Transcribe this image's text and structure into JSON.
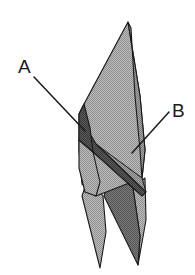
{
  "figure": {
    "background_color": "#ffffff",
    "outline_color": "#1a1a1a",
    "fill_light": "#a9a9a9",
    "fill_mid": "#939393",
    "fill_dark": "#6b6b6b",
    "fill_darkest": "#4a4a4a"
  },
  "labels": [
    {
      "id": "A",
      "text": "A",
      "text_x": 18,
      "text_y": 73,
      "leader_start_x": 34,
      "leader_start_y": 77,
      "leader_end_x": 85,
      "leader_end_y": 131
    },
    {
      "id": "B",
      "text": "B",
      "text_x": 172,
      "text_y": 117,
      "leader_start_x": 169,
      "leader_start_y": 112,
      "leader_end_x": 132,
      "leader_end_y": 153
    }
  ],
  "shapes": {
    "main_panel_points": "128,22 84,104 79,114 79,150 82,184 96,196 142,178 145,150 140,96",
    "right_sliver_points": "128,22 131,28 135,96 140,150 142,178 145,150 140,96",
    "left_dark_wedge_points": "84,104 79,114 79,140 93,152 90,128",
    "left_lower_flap_points": "79,140 79,168 85,192 96,196 100,182 93,152",
    "dark_diagonal_band_points": "86,127 93,152 142,196 146,192 96,144",
    "left_leg_points": "88,178 82,196 100,268 106,232 103,196",
    "right_leg_points": "112,170 104,196 138,265 140,236 133,188",
    "right_lower_panel_points": "133,188 140,236 138,265 146,220 145,178",
    "mid_crease_points": "96,144 146,192 142,178 104,150"
  },
  "shape_names": {
    "main_panel": "main-panel",
    "right_sliver": "right-sliver-panel",
    "left_dark_wedge": "left-dark-wedge",
    "left_lower_flap": "left-lower-flap",
    "dark_diagonal_band": "dark-diagonal-band",
    "left_leg": "left-leg-spike",
    "right_leg": "right-leg-spike",
    "right_lower_panel": "right-lower-panel",
    "mid_crease": "mid-crease-facet"
  }
}
